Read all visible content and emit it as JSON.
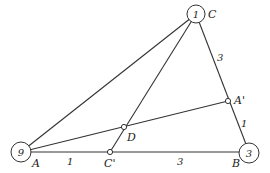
{
  "diagram": {
    "type": "mass-point triangle",
    "vertices": {
      "A": {
        "label": "A",
        "mass": "9"
      },
      "B": {
        "label": "B",
        "mass": "3"
      },
      "C": {
        "label": "C",
        "mass": "1"
      }
    },
    "points": {
      "A_prime": {
        "label": "A'"
      },
      "C_prime": {
        "label": "C'"
      },
      "D": {
        "label": "D"
      }
    },
    "segment_labels": {
      "AC_prime": "1",
      "C_primeB": "3",
      "CA_prime": "3",
      "A_primeB": "1"
    }
  }
}
